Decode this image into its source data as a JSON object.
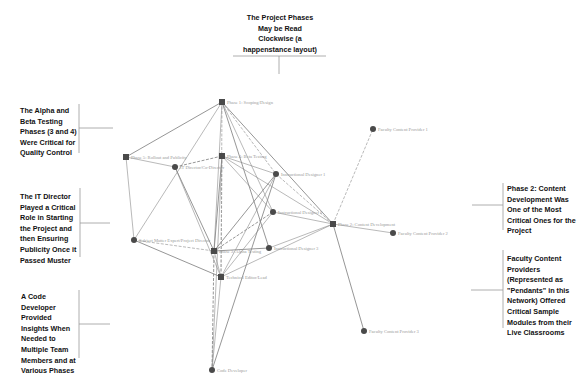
{
  "callouts": {
    "top": "The Project Phases May be Read Clockwise (a happenstance layout)",
    "left_1": "The Alpha and Beta Testing Phases (3 and 4) Were Critical for Quality Control",
    "left_2": "The IT Director Played a Critical Role in Starting the Project and then Ensuring Publicity Once it Passed Muster",
    "left_3": "A Code Developer Provided Insights When Needed to Multiple Team Members and at Various Phases",
    "right_1": "Phase 2: Content Development Was One of the Most Critical Ones for the Project",
    "right_2": "Faculty Content Providers (Represented as \"Pendants\" in this Network) Offered Critical Sample Modules from their Live Classrooms"
  },
  "nodes": [
    {
      "id": "p1",
      "label": "Phase 1: Scoping/Design",
      "shape": "square",
      "x": 222,
      "y": 102
    },
    {
      "id": "p5",
      "label": "Phase 5: Rollout and Publicity",
      "shape": "square",
      "x": 126,
      "y": 157
    },
    {
      "id": "p4",
      "label": "Phase 4: Beta Testing",
      "shape": "square",
      "x": 222,
      "y": 156
    },
    {
      "id": "itdir",
      "label": "IT Director/Co-Director",
      "shape": "circle",
      "x": 175,
      "y": 167
    },
    {
      "id": "id1",
      "label": "Instructional Designer 1",
      "shape": "circle",
      "x": 276,
      "y": 174
    },
    {
      "id": "id2",
      "label": "Instructional Designer 2",
      "shape": "circle",
      "x": 273,
      "y": 212
    },
    {
      "id": "id3",
      "label": "Instructional Designer 3",
      "shape": "circle",
      "x": 269,
      "y": 248
    },
    {
      "id": "p2",
      "label": "Phase 2: Content Development",
      "shape": "square",
      "x": 333,
      "y": 224
    },
    {
      "id": "p3",
      "label": "Phase 3: Alpha Testing",
      "shape": "square",
      "x": 214,
      "y": 251
    },
    {
      "id": "sme",
      "label": "Subject Matter Expert/Project Director",
      "shape": "circle",
      "x": 134,
      "y": 240
    },
    {
      "id": "tech",
      "label": "Technical Editor/Lead",
      "shape": "square",
      "x": 221,
      "y": 277
    },
    {
      "id": "fc1",
      "label": "Faculty Content Provider 1",
      "shape": "circle",
      "x": 373,
      "y": 129
    },
    {
      "id": "fc2",
      "label": "Faculty Content Provider 2",
      "shape": "circle",
      "x": 393,
      "y": 233
    },
    {
      "id": "fc3",
      "label": "Faculty Content Provider 3",
      "shape": "circle",
      "x": 364,
      "y": 331
    },
    {
      "id": "coder",
      "label": "Code Developer",
      "shape": "circle",
      "x": 212,
      "y": 370
    }
  ],
  "edges": [
    [
      "p1",
      "p5"
    ],
    [
      "p1",
      "id1"
    ],
    [
      "p1",
      "id2"
    ],
    [
      "p1",
      "id3"
    ],
    [
      "p1",
      "p3"
    ],
    [
      "p1",
      "tech"
    ],
    [
      "p1",
      "p2"
    ],
    [
      "p5",
      "itdir"
    ],
    [
      "p5",
      "sme"
    ],
    [
      "p4",
      "itdir"
    ],
    [
      "p4",
      "id1"
    ],
    [
      "p4",
      "id2"
    ],
    [
      "p4",
      "p3"
    ],
    [
      "p4",
      "tech"
    ],
    [
      "p4",
      "p2"
    ],
    [
      "itdir",
      "p3"
    ],
    [
      "itdir",
      "tech"
    ],
    [
      "id1",
      "p2"
    ],
    [
      "id1",
      "p3"
    ],
    [
      "id1",
      "tech"
    ],
    [
      "id2",
      "p2"
    ],
    [
      "id2",
      "p3"
    ],
    [
      "id2",
      "tech"
    ],
    [
      "id3",
      "p2"
    ],
    [
      "id3",
      "p3"
    ],
    [
      "p2",
      "fc1"
    ],
    [
      "p2",
      "fc2"
    ],
    [
      "p2",
      "fc3"
    ],
    [
      "p2",
      "tech"
    ],
    [
      "sme",
      "p3"
    ],
    [
      "sme",
      "tech"
    ],
    [
      "sme",
      "p1"
    ],
    [
      "p3",
      "tech"
    ],
    [
      "p3",
      "coder"
    ],
    [
      "tech",
      "coder"
    ],
    [
      "p4",
      "coder"
    ],
    [
      "id1",
      "coder"
    ]
  ],
  "colors": {
    "edge": "#8a8a8a",
    "node": "#4a4a4a",
    "callout_bracket": "#9a9a9a"
  }
}
